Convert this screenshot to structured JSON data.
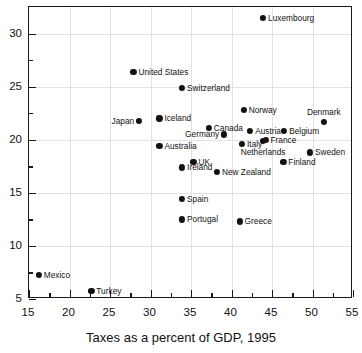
{
  "chart_data": {
    "type": "scatter",
    "title": "",
    "xlabel": "Taxes as a percent of GDP, 1995",
    "ylabel": "",
    "xlim": [
      15,
      55
    ],
    "ylim": [
      5,
      32.5
    ],
    "xticks": [
      15,
      20,
      25,
      30,
      35,
      40,
      45,
      50,
      55
    ],
    "xtick_labels": [
      "15",
      "20",
      "25",
      "30",
      "35",
      "40",
      "45",
      "50",
      "55"
    ],
    "xminor_ticks": [
      17.5,
      22.5,
      27.5,
      32.5,
      37.5,
      42.5,
      47.5,
      52.5
    ],
    "yticks": [
      5,
      10,
      15,
      20,
      25,
      30
    ],
    "ytick_labels": [
      "5",
      "10",
      "15",
      "20",
      "25",
      "30"
    ],
    "yminor_ticks": [
      7.5,
      12.5,
      17.5,
      22.5,
      27.5
    ],
    "grid": true,
    "legend": "none",
    "marker_color": "#111111",
    "grid_color": "#e2e2e2",
    "axis_color": "#1a1a1a",
    "points": [
      {
        "label": "Luxembourg",
        "x": 43.9,
        "y": 31.5,
        "pos": "right"
      },
      {
        "label": "United States",
        "x": 27.9,
        "y": 26.4,
        "pos": "right"
      },
      {
        "label": "Switzerland",
        "x": 33.9,
        "y": 24.9,
        "pos": "right"
      },
      {
        "label": "Norway",
        "x": 41.5,
        "y": 22.8,
        "pos": "right"
      },
      {
        "label": "Denmark",
        "x": 51.4,
        "y": 21.7,
        "pos": "above"
      },
      {
        "label": "Japan",
        "x": 28.6,
        "y": 21.8,
        "pos": "left"
      },
      {
        "label": "Iceland",
        "x": 31.1,
        "y": 22.0,
        "pos": "right"
      },
      {
        "label": "Canada",
        "x": 37.2,
        "y": 21.1,
        "pos": "right"
      },
      {
        "label": "Austria",
        "x": 42.3,
        "y": 20.8,
        "pos": "right"
      },
      {
        "label": "Belgium",
        "x": 46.5,
        "y": 20.8,
        "pos": "right"
      },
      {
        "label": "Germany",
        "x": 39.1,
        "y": 20.5,
        "pos": "left"
      },
      {
        "label": "France",
        "x": 44.2,
        "y": 20.0,
        "pos": "right"
      },
      {
        "label": "Italy",
        "x": 41.3,
        "y": 19.6,
        "pos": "right"
      },
      {
        "label": "Australia",
        "x": 31.1,
        "y": 19.4,
        "pos": "right"
      },
      {
        "label": "Netherlands",
        "x": 43.9,
        "y": 19.9,
        "pos": "below"
      },
      {
        "label": "Sweden",
        "x": 49.7,
        "y": 18.8,
        "pos": "right"
      },
      {
        "label": "UK",
        "x": 35.3,
        "y": 17.9,
        "pos": "right"
      },
      {
        "label": "Finland",
        "x": 46.4,
        "y": 17.9,
        "pos": "right"
      },
      {
        "label": "Ireland",
        "x": 33.9,
        "y": 17.4,
        "pos": "right"
      },
      {
        "label": "New Zealand",
        "x": 38.2,
        "y": 17.0,
        "pos": "right"
      },
      {
        "label": "Spain",
        "x": 33.9,
        "y": 14.4,
        "pos": "right"
      },
      {
        "label": "Portugal",
        "x": 33.9,
        "y": 12.5,
        "pos": "right"
      },
      {
        "label": "Greece",
        "x": 41.0,
        "y": 12.3,
        "pos": "right"
      },
      {
        "label": "Mexico",
        "x": 16.2,
        "y": 7.3,
        "pos": "right"
      },
      {
        "label": "Turkey",
        "x": 22.7,
        "y": 5.8,
        "pos": "right"
      }
    ]
  },
  "axis_title": "Taxes as a percent of GDP, 1995"
}
